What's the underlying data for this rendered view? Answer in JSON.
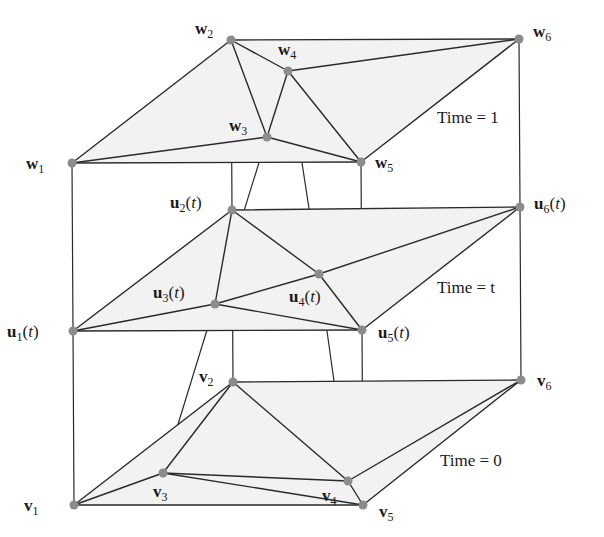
{
  "diagram": {
    "layers": [
      {
        "id": "top",
        "time_label": "Time = 1",
        "vertices": [
          {
            "name": "w",
            "sub": "1",
            "arg": "",
            "x": 72,
            "y": 163
          },
          {
            "name": "w",
            "sub": "2",
            "arg": "",
            "x": 231,
            "y": 40
          },
          {
            "name": "w",
            "sub": "3",
            "arg": "",
            "x": 267,
            "y": 137
          },
          {
            "name": "w",
            "sub": "4",
            "arg": "",
            "x": 288,
            "y": 71
          },
          {
            "name": "w",
            "sub": "5",
            "arg": "",
            "x": 361,
            "y": 162
          },
          {
            "name": "w",
            "sub": "6",
            "arg": "",
            "x": 519,
            "y": 39
          }
        ]
      },
      {
        "id": "middle",
        "time_label": "Time = t",
        "vertices": [
          {
            "name": "u",
            "sub": "1",
            "arg": "(t)",
            "x": 73,
            "y": 331
          },
          {
            "name": "u",
            "sub": "2",
            "arg": "(t)",
            "x": 232,
            "y": 210
          },
          {
            "name": "u",
            "sub": "3",
            "arg": "(t)",
            "x": 215,
            "y": 304
          },
          {
            "name": "u",
            "sub": "4",
            "arg": "(t)",
            "x": 319,
            "y": 274
          },
          {
            "name": "u",
            "sub": "5",
            "arg": "(t)",
            "x": 362,
            "y": 330
          },
          {
            "name": "u",
            "sub": "6",
            "arg": "(t)",
            "x": 520,
            "y": 207
          }
        ]
      },
      {
        "id": "bottom",
        "time_label": "Time = 0",
        "vertices": [
          {
            "name": "v",
            "sub": "1",
            "arg": "",
            "x": 74,
            "y": 505
          },
          {
            "name": "v",
            "sub": "2",
            "arg": "",
            "x": 233,
            "y": 382
          },
          {
            "name": "v",
            "sub": "3",
            "arg": "",
            "x": 163,
            "y": 473
          },
          {
            "name": "v",
            "sub": "4",
            "arg": "",
            "x": 348,
            "y": 481
          },
          {
            "name": "v",
            "sub": "5",
            "arg": "",
            "x": 363,
            "y": 505
          },
          {
            "name": "v",
            "sub": "6",
            "arg": "",
            "x": 521,
            "y": 380
          }
        ]
      }
    ],
    "edges": [
      [
        1,
        2
      ],
      [
        2,
        6
      ],
      [
        1,
        5
      ],
      [
        5,
        6
      ],
      [
        1,
        3
      ],
      [
        2,
        3
      ],
      [
        2,
        4
      ],
      [
        3,
        4
      ],
      [
        3,
        5
      ],
      [
        4,
        5
      ],
      [
        4,
        6
      ]
    ],
    "colors": {
      "face_fill": "#f2f2f2",
      "edge": "#2a2a2a",
      "vertex": "#8c8c8c",
      "text": "#1a1a1a"
    }
  }
}
